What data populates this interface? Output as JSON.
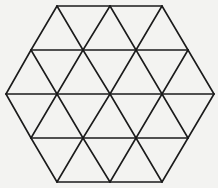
{
  "diagram": {
    "title": "",
    "shape": "hexagon",
    "triangle_count": 24,
    "colors": {
      "background": "#f3f3f1",
      "stroke": "#1b1b1b"
    },
    "rows": [
      {
        "y": 6,
        "x": [
          57,
          110,
          162
        ]
      },
      {
        "y": 50,
        "x": [
          31,
          83,
          136,
          188
        ]
      },
      {
        "y": 94,
        "x": [
          6,
          57,
          110,
          162,
          214
        ]
      },
      {
        "y": 138,
        "x": [
          31,
          83,
          136,
          188
        ]
      },
      {
        "y": 182,
        "x": [
          57,
          110,
          162
        ]
      }
    ]
  }
}
